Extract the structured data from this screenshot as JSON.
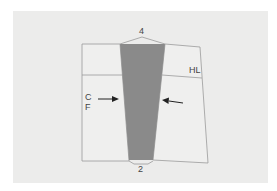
{
  "diagram": {
    "type": "sewing-pattern-dart",
    "labels": {
      "top_dart_number": "4",
      "bottom_dart_number": "2",
      "hip_line": "HL",
      "center_front_c": "C",
      "center_front_f": "F"
    },
    "colors": {
      "background": "#ececeb",
      "piece_fill": "#efefee",
      "outline": "#9a9a9a",
      "dart_fill": "#8a8a8a",
      "arrow": "#222222",
      "text": "#444444"
    }
  }
}
